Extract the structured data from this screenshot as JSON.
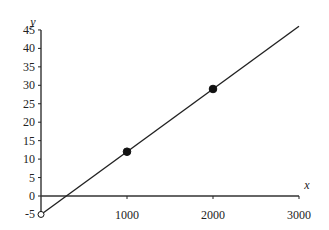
{
  "chart_data": {
    "type": "line",
    "title": "",
    "xlabel": "x",
    "ylabel": "y",
    "xlim": [
      0,
      3000
    ],
    "ylim": [
      -5,
      45
    ],
    "x_ticks": [
      1000,
      2000,
      3000
    ],
    "x_tick_labels": [
      "1000",
      "2000",
      "3000"
    ],
    "origin_label": "0",
    "y_ticks": [
      -5,
      0,
      5,
      10,
      15,
      20,
      25,
      30,
      35,
      40,
      45
    ],
    "y_tick_labels": [
      "-5",
      "0",
      "5",
      "10",
      "15",
      "20",
      "25",
      "30",
      "35",
      "40",
      "45"
    ],
    "grid": false,
    "legend": null,
    "series": [
      {
        "name": "fitted line",
        "type": "line",
        "x": [
          0,
          3000
        ],
        "y": [
          -5,
          46
        ]
      },
      {
        "name": "points",
        "type": "scatter",
        "x": [
          0,
          1000,
          2000
        ],
        "y": [
          -5,
          12,
          29
        ],
        "marker": [
          "open",
          "filled",
          "filled"
        ]
      }
    ]
  }
}
